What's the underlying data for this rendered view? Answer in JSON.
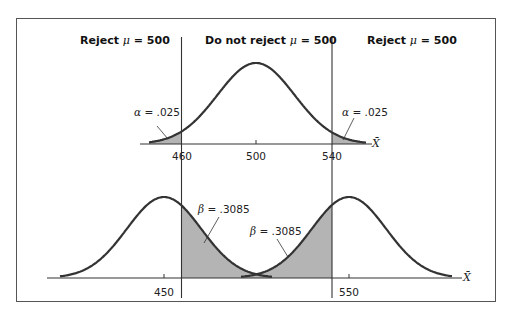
{
  "chart_data": {
    "type": "area",
    "title": "",
    "regions": [
      {
        "label_prefix": "Reject",
        "label_suffix": "= 500",
        "symbol": "μ",
        "position": "left"
      },
      {
        "label_prefix": "Do not reject",
        "label_suffix": "= 500",
        "symbol": "μ",
        "position": "center"
      },
      {
        "label_prefix": "Reject",
        "label_suffix": "= 500",
        "symbol": "μ",
        "position": "right"
      }
    ],
    "panels": [
      {
        "name": "null-distribution",
        "xlabel": "X̄",
        "ticks": [
          "460",
          "500",
          "540"
        ],
        "distributions": [
          {
            "mean": 500,
            "sd": 20.4
          }
        ],
        "critical_values": [
          460,
          540
        ],
        "annotations": [
          {
            "symbol": "α",
            "text": "= .025",
            "side": "left"
          },
          {
            "symbol": "α",
            "text": "= .025",
            "side": "right"
          }
        ]
      },
      {
        "name": "alternative-distributions",
        "xlabel": "X̄",
        "ticks": [
          "450",
          "550"
        ],
        "distributions": [
          {
            "mean": 450,
            "sd": 20
          },
          {
            "mean": 550,
            "sd": 20
          }
        ],
        "critical_values": [
          460,
          540
        ],
        "annotations": [
          {
            "symbol": "β",
            "text": "= .3085",
            "side": "left"
          },
          {
            "symbol": "β",
            "text": "= .3085",
            "side": "right"
          }
        ]
      }
    ],
    "colors": {
      "shade": "#b4b4b4",
      "curve": "#333333",
      "axis": "#333333",
      "frame": "#555555"
    }
  }
}
